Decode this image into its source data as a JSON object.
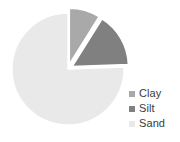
{
  "chart_data": {
    "type": "pie",
    "title": "",
    "labels": [
      "Clay",
      "Silt",
      "Sand"
    ],
    "values": [
      9,
      16,
      75
    ],
    "unit": "%",
    "colors": [
      "#a9a9a9",
      "#808080",
      "#e9e9e9"
    ],
    "legend_position": "right",
    "grid": false,
    "start_angle_deg": 0,
    "direction": "clockwise",
    "exploded_slices": [
      "Clay",
      "Silt"
    ],
    "explode_offset_px": 5,
    "slice_angles_deg": [
      {
        "label": "Clay",
        "start": 0,
        "end": 32
      },
      {
        "label": "Silt",
        "start": 32,
        "end": 88
      },
      {
        "label": "Sand",
        "start": 88,
        "end": 360
      }
    ]
  },
  "legend": {
    "items": [
      {
        "label": "Clay",
        "color": "#a9a9a9",
        "swatch_name": "legend-swatch-clay"
      },
      {
        "label": "Silt",
        "color": "#808080",
        "swatch_name": "legend-swatch-silt"
      },
      {
        "label": "Sand",
        "color": "#e9e9e9",
        "swatch_name": "legend-swatch-sand"
      }
    ]
  },
  "pie": {
    "center_x": 68,
    "center_y": 69,
    "radius": 56,
    "separator_color": "#ffffff",
    "background": "#ffffff"
  }
}
